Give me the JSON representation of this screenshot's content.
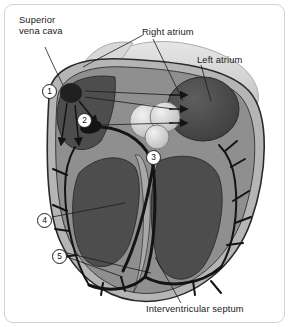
{
  "figure": {
    "background_color": "#ffffff",
    "card_border_color": "#d2d2d2",
    "palette": {
      "chamber_dark": "#4a4a4a",
      "myocardium_mid": "#8a8a8a",
      "tissue_light": "#b5b5b5",
      "vessel_pale": "#cfcfcf",
      "valve_highlight": "#e2e2e2",
      "conduction_black": "#141414",
      "outline": "#2a2a2a",
      "label_text": "#1a1a1a"
    }
  },
  "labels": [
    {
      "id": "superior-vena-cava",
      "line1": "Superior",
      "line2": "vena cava",
      "x": 18,
      "y": 14
    },
    {
      "id": "right-atrium",
      "text": "Right atrium",
      "x": 141,
      "y": 26
    },
    {
      "id": "left-atrium",
      "text": "Left atrium",
      "x": 196,
      "y": 54
    },
    {
      "id": "interventricular-septum",
      "text": "Interventricular septum",
      "x": 155,
      "y": 303
    }
  ],
  "callouts": [
    {
      "id": "callout-1",
      "number": "1",
      "x": 41,
      "y": 83
    },
    {
      "id": "callout-2",
      "number": "2",
      "x": 76,
      "y": 112
    },
    {
      "id": "callout-3",
      "number": "3",
      "x": 145,
      "y": 149
    },
    {
      "id": "callout-4",
      "number": "4",
      "x": 36,
      "y": 212
    },
    {
      "id": "callout-5",
      "number": "5",
      "x": 51,
      "y": 248
    }
  ]
}
